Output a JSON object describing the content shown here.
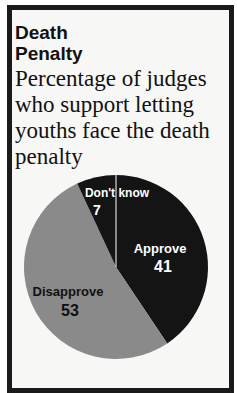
{
  "header": {
    "title_line1": "Death",
    "title_line2": "Penalty",
    "subtitle": "Percentage of judges who support letting youths face the death penalty"
  },
  "colors": {
    "approve": "#141414",
    "disapprove": "#8a8a8a",
    "dont_know": "#141414",
    "frame": "#1a1a1a"
  },
  "chart_data": {
    "type": "pie",
    "title": "Death Penalty",
    "subtitle": "Percentage of judges who support letting youths face the death penalty",
    "categories": [
      "Approve",
      "Disapprove",
      "Don't know"
    ],
    "values": [
      41,
      53,
      7
    ],
    "labels": {
      "approve": {
        "name": "Approve",
        "value": "41"
      },
      "disapprove": {
        "name": "Disapprove",
        "value": "53"
      },
      "dont_know": {
        "name": "Don't know",
        "value": "7"
      }
    },
    "legend": "none (inline labels)"
  }
}
